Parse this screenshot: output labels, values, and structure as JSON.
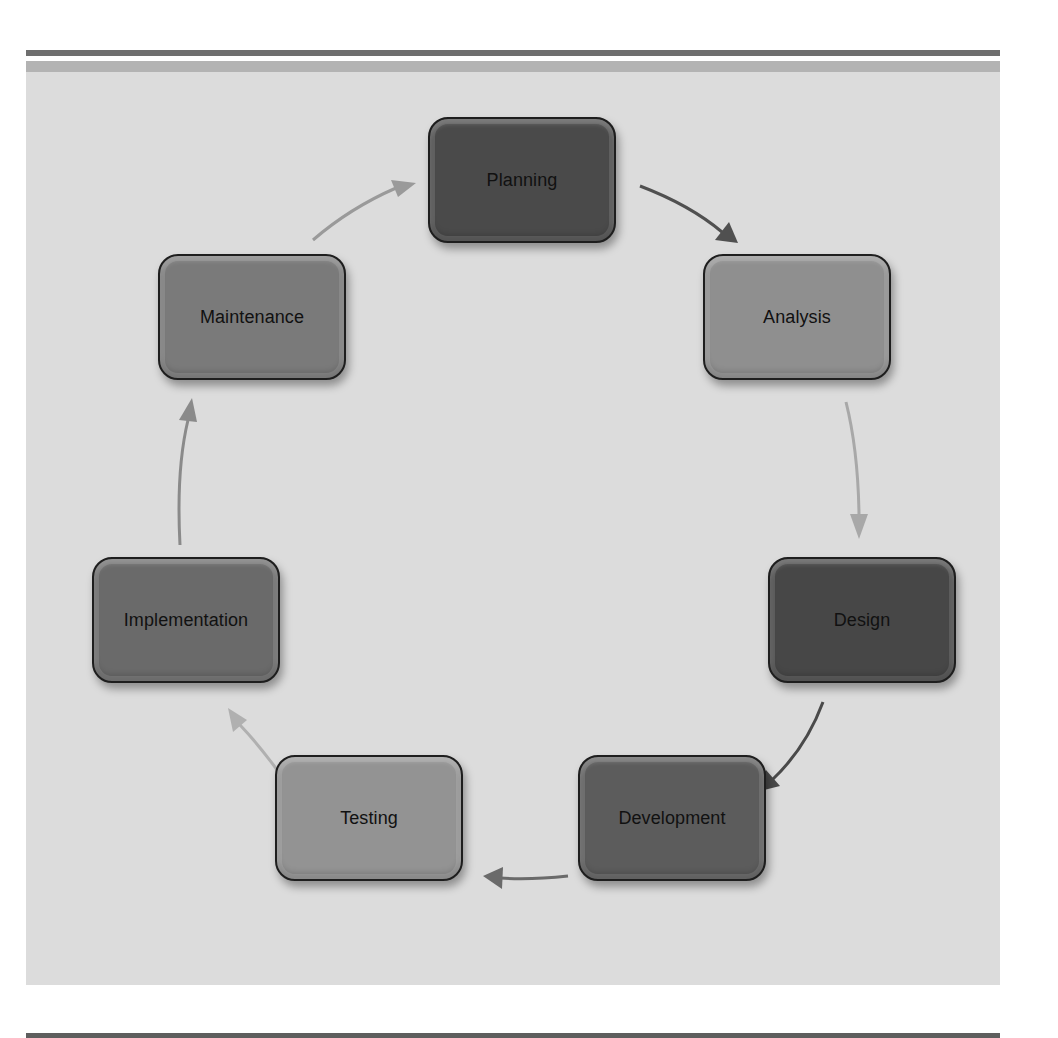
{
  "figure": {
    "type": "cycle",
    "title": "",
    "stages": [
      {
        "id": "planning",
        "label": "Planning",
        "fill": "#4a4a4a"
      },
      {
        "id": "analysis",
        "label": "Analysis",
        "fill": "#8f8f8f"
      },
      {
        "id": "design",
        "label": "Design",
        "fill": "#474747"
      },
      {
        "id": "development",
        "label": "Development",
        "fill": "#5c5c5c"
      },
      {
        "id": "testing",
        "label": "Testing",
        "fill": "#939393"
      },
      {
        "id": "implementation",
        "label": "Implementation",
        "fill": "#6a6a6a"
      },
      {
        "id": "maintenance",
        "label": "Maintenance",
        "fill": "#7a7a7a"
      }
    ],
    "flow": [
      {
        "from": "Planning",
        "to": "Analysis",
        "color": "#505050"
      },
      {
        "from": "Analysis",
        "to": "Design",
        "color": "#a8a8a8"
      },
      {
        "from": "Design",
        "to": "Development",
        "color": "#4a4a4a"
      },
      {
        "from": "Development",
        "to": "Testing",
        "color": "#6a6a6a"
      },
      {
        "from": "Testing",
        "to": "Implementation",
        "color": "#b0b0b0"
      },
      {
        "from": "Implementation",
        "to": "Maintenance",
        "color": "#8a8a8a"
      },
      {
        "from": "Maintenance",
        "to": "Planning",
        "color": "#9a9a9a"
      }
    ]
  },
  "colors": {
    "panel_bg": "#dcdcdc",
    "panel_band": "#b3b3b3",
    "rule": "#6e6e6e",
    "box_border": "#1e1e1e",
    "label_text": "#111111"
  }
}
